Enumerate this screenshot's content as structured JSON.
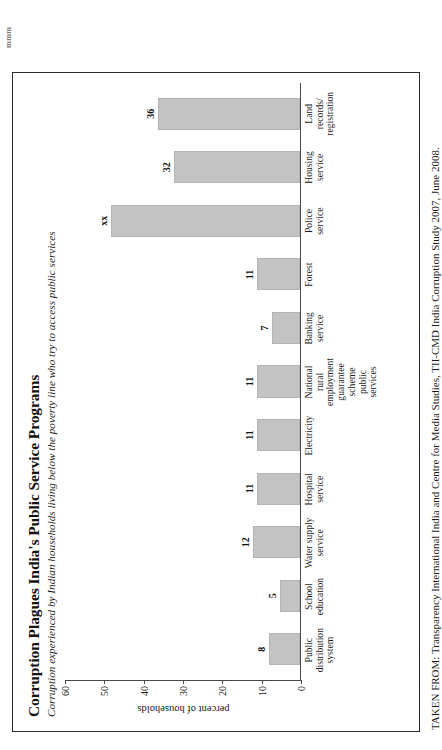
{
  "page": {
    "top_scrap_text": "mmm"
  },
  "chart_data": {
    "type": "bar",
    "title": "Corruption Plagues India's Public Service Programs",
    "subtitle": "Corruption experienced by Indian households living below the poverty line who try to access public services",
    "xlabel": "",
    "ylabel": "percent of households",
    "ylim": [
      0,
      60
    ],
    "yticks": [
      0,
      10,
      20,
      30,
      40,
      50,
      60
    ],
    "grid": false,
    "legend": "none",
    "bar_color": "#c3c3c3",
    "categories": [
      "Public distribution system",
      "School education",
      "Water supply service",
      "Hospital service",
      "Electricity",
      "National rural employment guarantee scheme public services",
      "Banking service",
      "Forest",
      "Police service",
      "Housing service",
      "Land records/ registration"
    ],
    "values": [
      8,
      5,
      12,
      11,
      11,
      11,
      7,
      11,
      48,
      32,
      36
    ],
    "value_labels": [
      "8",
      "5",
      "12",
      "11",
      "11",
      "11",
      "7",
      "11",
      "xx",
      "32",
      "36"
    ]
  },
  "source": {
    "text": "TAKEN FROM: Transparency International India and Centre for Media Studies, TII-CMD India Corruption Study 2007, June 2008."
  }
}
